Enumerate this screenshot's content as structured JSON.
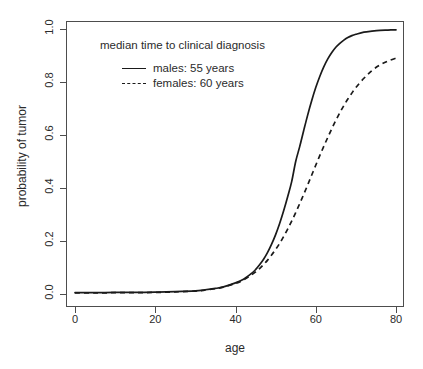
{
  "chart_data": {
    "type": "line",
    "title": "",
    "xlabel": "age",
    "ylabel": "probability of tumor",
    "xlim": [
      0,
      80
    ],
    "ylim": [
      0.0,
      1.0
    ],
    "grid": false,
    "legend_position": "top-left-inside",
    "annotation": "median time to clinical diagnosis",
    "xticks": [
      0,
      20,
      40,
      60,
      80
    ],
    "xtick_labels": [
      "0",
      "20",
      "40",
      "60",
      "80"
    ],
    "yticks": [
      0.0,
      0.2,
      0.4,
      0.6,
      0.8,
      1.0
    ],
    "ytick_labels": [
      "0.0",
      "0.2",
      "0.4",
      "0.6",
      "0.8",
      "1.0"
    ],
    "x": [
      0,
      5,
      10,
      15,
      20,
      25,
      30,
      32,
      35,
      37,
      40,
      42,
      44,
      45,
      46,
      47,
      48,
      49,
      50,
      51,
      52,
      53,
      54,
      55,
      56,
      57,
      58,
      59,
      60,
      61,
      62,
      63,
      64,
      65,
      66,
      67,
      68,
      69,
      70,
      72,
      74,
      76,
      78,
      80
    ],
    "series": [
      {
        "name": "males: 55 years",
        "style": "solid",
        "color": "#1a1a1a",
        "median_age": 55,
        "values": [
          0.005,
          0.005,
          0.006,
          0.006,
          0.007,
          0.009,
          0.012,
          0.015,
          0.021,
          0.027,
          0.042,
          0.056,
          0.078,
          0.092,
          0.11,
          0.131,
          0.157,
          0.188,
          0.224,
          0.266,
          0.314,
          0.367,
          0.424,
          0.5,
          0.556,
          0.617,
          0.676,
          0.73,
          0.779,
          0.821,
          0.857,
          0.887,
          0.911,
          0.931,
          0.946,
          0.958,
          0.968,
          0.975,
          0.98,
          0.988,
          0.992,
          0.995,
          0.996,
          0.997
        ]
      },
      {
        "name": "females: 60 years",
        "style": "dashed",
        "color": "#1a1a1a",
        "median_age": 60,
        "values": [
          0.004,
          0.004,
          0.005,
          0.005,
          0.006,
          0.008,
          0.011,
          0.014,
          0.02,
          0.026,
          0.04,
          0.053,
          0.072,
          0.083,
          0.096,
          0.111,
          0.128,
          0.147,
          0.168,
          0.191,
          0.217,
          0.245,
          0.275,
          0.307,
          0.341,
          0.376,
          0.412,
          0.449,
          0.486,
          0.522,
          0.557,
          0.591,
          0.624,
          0.655,
          0.684,
          0.711,
          0.736,
          0.758,
          0.779,
          0.814,
          0.843,
          0.864,
          0.879,
          0.89
        ]
      }
    ]
  },
  "axes": {
    "x_title": "age",
    "y_title": "probability of tumor"
  },
  "legend": {
    "title": "median time to clinical diagnosis",
    "entries": [
      {
        "label": "males: 55 years",
        "style": "solid"
      },
      {
        "label": "females: 60 years",
        "style": "dashed"
      }
    ]
  }
}
